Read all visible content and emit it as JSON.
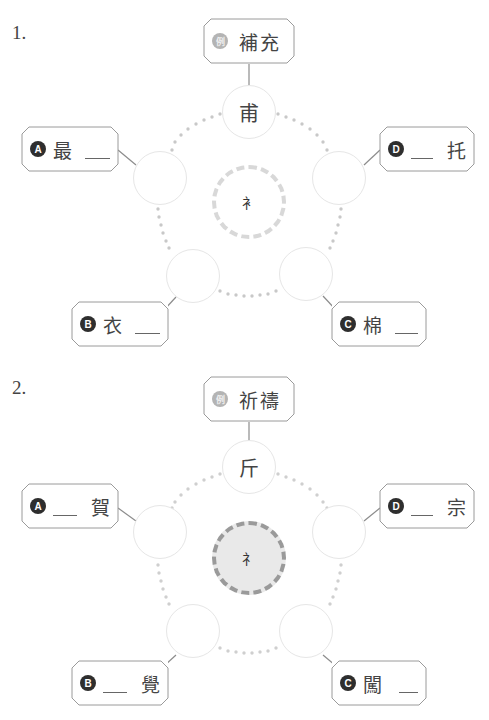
{
  "questions": [
    {
      "number": "1.",
      "radical": "衤",
      "component": "甫",
      "example": {
        "badge": "例",
        "word": "補充"
      },
      "items": [
        {
          "badge": "A",
          "before": "最",
          "after": ""
        },
        {
          "badge": "B",
          "before": "衣",
          "after": ""
        },
        {
          "badge": "C",
          "before": "棉",
          "after": ""
        },
        {
          "badge": "D",
          "before": "",
          "after": "托"
        }
      ]
    },
    {
      "number": "2.",
      "radical": "礻",
      "component": "斤",
      "example": {
        "badge": "例",
        "word": "祈禱"
      },
      "items": [
        {
          "badge": "A",
          "before": "",
          "after": "賀"
        },
        {
          "badge": "B",
          "before": "",
          "after": "覺"
        },
        {
          "badge": "C",
          "before": "闖",
          "after": ""
        },
        {
          "badge": "D",
          "before": "",
          "after": "宗"
        }
      ]
    }
  ],
  "colors": {
    "badge_dark": "#2e2e2e",
    "badge_example": "#b4b4b4",
    "circle_border": "#e6e6e6",
    "dots": "#c8c8c8",
    "center_fill_q2": "#e9e9e9"
  }
}
